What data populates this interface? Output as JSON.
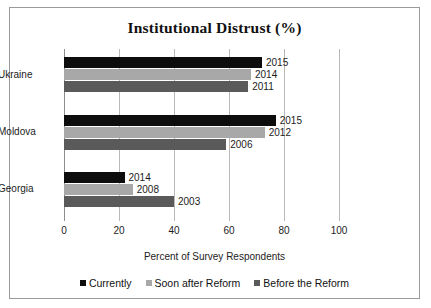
{
  "chart_data": {
    "type": "bar",
    "orientation": "horizontal",
    "title": "Institutional Distrust (%)",
    "xlabel": "Percent of Survey Respondents",
    "ylabel": "",
    "xlim": [
      0,
      100
    ],
    "xticks": [
      0,
      20,
      40,
      60,
      80,
      100
    ],
    "grid": true,
    "legend_position": "bottom",
    "categories": [
      "Ukraine",
      "Moldova",
      "Georgia"
    ],
    "series": [
      {
        "name": "Currently",
        "color": "#0d0d0d",
        "values": [
          72,
          77,
          22
        ],
        "point_labels": [
          "2015",
          "2015",
          "2014"
        ]
      },
      {
        "name": "Soon after Reform",
        "color": "#a8a8a8",
        "values": [
          68,
          73,
          25
        ],
        "point_labels": [
          "2014",
          "2012",
          "2008"
        ]
      },
      {
        "name": "Before the Reform",
        "color": "#5a5a5a",
        "values": [
          67,
          59,
          40
        ],
        "point_labels": [
          "2011",
          "2006",
          "2003"
        ]
      }
    ]
  },
  "xtick_labels": [
    "0",
    "20",
    "40",
    "60",
    "80",
    "100"
  ],
  "legend": [
    {
      "label": "Currently",
      "color": "#0d0d0d"
    },
    {
      "label": "Soon after Reform",
      "color": "#a8a8a8"
    },
    {
      "label": "Before the Reform",
      "color": "#5a5a5a"
    }
  ]
}
